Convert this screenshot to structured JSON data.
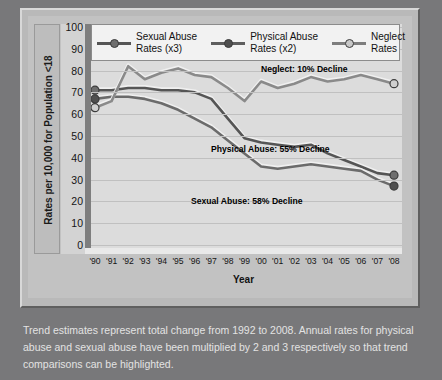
{
  "chart_data": {
    "type": "line",
    "title": "",
    "xlabel": "Year",
    "ylabel": "Rates per 10,000 for Population <18",
    "ylim": [
      0,
      100
    ],
    "yticks": [
      100,
      90,
      80,
      70,
      60,
      50,
      40,
      30,
      20,
      10,
      0
    ],
    "grid": true,
    "legend_position": "top",
    "categories": [
      "'90",
      "'91",
      "'92",
      "'93",
      "'94",
      "'95",
      "'96",
      "'97",
      "'98",
      "'99",
      "'00",
      "'01",
      "'02",
      "'03",
      "'04",
      "'05",
      "'06",
      "'07",
      "'08"
    ],
    "x_years": [
      1990,
      1991,
      1992,
      1993,
      1994,
      1995,
      1996,
      1997,
      1998,
      1999,
      2000,
      2001,
      2002,
      2003,
      2004,
      2005,
      2006,
      2007,
      2008
    ],
    "series": [
      {
        "name": "Sexual Abuse Rates (x3)",
        "key": "sexual",
        "color": "#555555",
        "values": [
          71,
          71,
          72,
          72,
          71,
          71,
          70,
          67,
          58,
          49,
          47,
          46,
          45,
          46,
          42,
          39,
          36,
          33,
          32
        ]
      },
      {
        "name": "Physical Abuse Rates (x2)",
        "key": "physical",
        "color": "#6b6b6b",
        "values": [
          67,
          68,
          68,
          67,
          65,
          62,
          58,
          54,
          48,
          42,
          36,
          35,
          36,
          37,
          36,
          35,
          34,
          30,
          27
        ]
      },
      {
        "name": "Neglect Rates",
        "key": "neglect",
        "color": "#8a8a8a",
        "values": [
          63,
          66,
          82,
          76,
          79,
          81,
          78,
          77,
          72,
          66,
          75,
          72,
          74,
          77,
          75,
          76,
          78,
          76,
          74
        ]
      }
    ],
    "annotations": [
      {
        "key": "neglect",
        "text": "Neglect: 10% Decline"
      },
      {
        "key": "physical",
        "text": "Physical Abuse: 55% Decline"
      },
      {
        "key": "sexual",
        "text": "Sexual Abuse: 58% Decline"
      }
    ]
  },
  "legend": {
    "items": [
      {
        "label_line1": "Sexual Abuse",
        "label_line2": "Rates (x3)"
      },
      {
        "label_line1": "Physical Abuse",
        "label_line2": "Rates (x2)"
      },
      {
        "label_line1": "Neglect",
        "label_line2": "Rates"
      }
    ]
  },
  "caption": {
    "text": "Trend estimates represent total change from 1992 to 2008. Annual rates for physical abuse and sexual abuse have been multiplied by 2 and 3 respectively so that trend comparisons can be highlighted."
  }
}
